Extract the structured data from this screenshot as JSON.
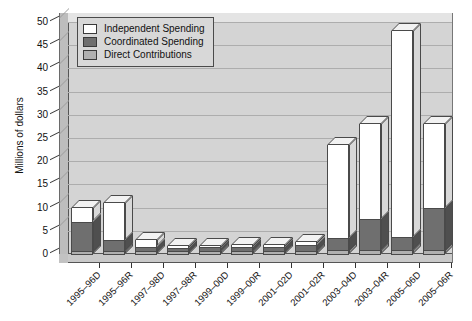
{
  "chart_data": {
    "type": "bar",
    "subtype": "stacked-3d-column",
    "title": "",
    "xlabel": "",
    "ylabel": "Millions of dollars",
    "ylim": [
      0,
      50
    ],
    "ytick_step": 5,
    "yticks": [
      "0",
      "5",
      "10",
      "15",
      "20",
      "25",
      "30",
      "35",
      "40",
      "45",
      "50"
    ],
    "grid": true,
    "legend_position": "top-left-inside",
    "categories": [
      "1995–96D",
      "1995–96R",
      "1997–98D",
      "1997–98R",
      "1999–00D",
      "1999–00R",
      "2001–02D",
      "2001–02R",
      "2003–04D",
      "2003–04R",
      "2005–06D",
      "2005–06R"
    ],
    "series": [
      {
        "name": "Direct Contributions",
        "color": "#b0b0b0",
        "values": [
          0.6,
          0.7,
          0.6,
          0.6,
          0.6,
          0.6,
          0.6,
          0.7,
          0.8,
          0.8,
          0.8,
          0.8
        ]
      },
      {
        "name": "Coordinated Spending",
        "color": "#6f6f6f",
        "values": [
          6.4,
          2.3,
          1.0,
          0.8,
          0.9,
          0.9,
          1.0,
          1.3,
          2.7,
          6.7,
          2.9,
          9.2
        ]
      },
      {
        "name": "Independent Spending",
        "color": "#ffffff",
        "values": [
          2.9,
          8.0,
          1.4,
          0.3,
          0.3,
          0.4,
          0.3,
          0.5,
          20.0,
          20.5,
          44.3,
          18.0
        ]
      }
    ],
    "totals": [
      9.9,
      11.0,
      3.0,
      1.7,
      1.8,
      1.9,
      1.9,
      2.5,
      23.5,
      28.0,
      48.0,
      28.0
    ]
  },
  "legend": {
    "items": [
      {
        "label": "Independent Spending",
        "swatch": "#ffffff"
      },
      {
        "label": "Coordinated Spending",
        "swatch": "#6f6f6f"
      },
      {
        "label": "Direct Contributions",
        "swatch": "#b0b0b0"
      }
    ]
  },
  "colors": {
    "plot_background": "#d4d4d4",
    "gridline": "#adadad",
    "axis": "#333333",
    "bar_outline": "#4a4a4a",
    "page_background": "#ffffff"
  }
}
